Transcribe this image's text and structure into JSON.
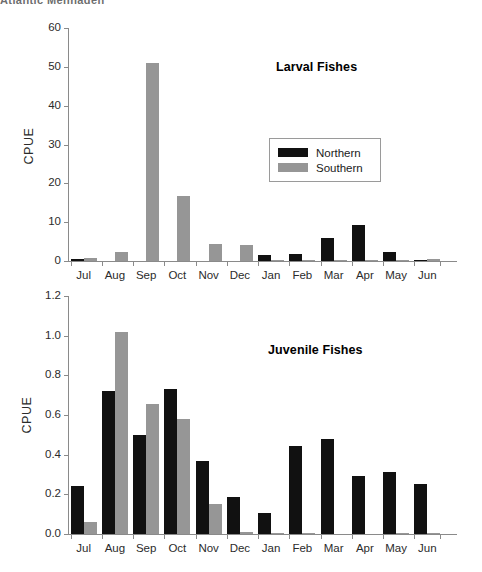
{
  "cutoff_header": "Atlantic Menhaden",
  "legend": {
    "items": [
      {
        "label": "Northern",
        "color": "#111111",
        "key": "northern"
      },
      {
        "label": "Southern",
        "color": "#969696",
        "key": "southern"
      }
    ]
  },
  "axis_titles": {
    "larval_y": "CPUE",
    "juvenile_y": "CPUE"
  },
  "chart_data": [
    {
      "id": "larval",
      "type": "bar",
      "title": "Larval Fishes",
      "xlabel": "",
      "ylabel": "CPUE",
      "ylim": [
        0,
        60
      ],
      "yticks": [
        0,
        10,
        20,
        30,
        40,
        50,
        60
      ],
      "ytick_labels": [
        "0",
        "10",
        "20",
        "30",
        "40",
        "50",
        "60"
      ],
      "grid": false,
      "legend_position": "upper-right-inside",
      "categories": [
        "Jul",
        "Aug",
        "Sep",
        "Oct",
        "Nov",
        "Dec",
        "Jan",
        "Feb",
        "Mar",
        "Apr",
        "May",
        "Jun"
      ],
      "series": [
        {
          "name": "Northern",
          "color": "#111111",
          "values": [
            0.6,
            0.0,
            0.0,
            0.0,
            0.0,
            0.0,
            1.6,
            1.8,
            5.9,
            9.2,
            2.4,
            0.2
          ]
        },
        {
          "name": "Southern",
          "color": "#969696",
          "values": [
            0.9,
            2.4,
            51.0,
            16.8,
            4.5,
            4.0,
            0.3,
            0.05,
            0.1,
            0.05,
            0.1,
            0.6
          ]
        }
      ]
    },
    {
      "id": "juvenile",
      "type": "bar",
      "title": "Juvenile Fishes",
      "xlabel": "",
      "ylabel": "CPUE",
      "ylim": [
        0,
        1.2
      ],
      "yticks": [
        0.0,
        0.2,
        0.4,
        0.6,
        0.8,
        1.0,
        1.2
      ],
      "ytick_labels": [
        "0.0",
        "0.2",
        "0.4",
        "0.6",
        "0.8",
        "1.0",
        "1.2"
      ],
      "grid": false,
      "legend_position": "none",
      "categories": [
        "Jul",
        "Aug",
        "Sep",
        "Oct",
        "Nov",
        "Dec",
        "Jan",
        "Feb",
        "Mar",
        "Apr",
        "May",
        "Jun"
      ],
      "series": [
        {
          "name": "Northern",
          "color": "#111111",
          "values": [
            0.24,
            0.72,
            0.5,
            0.73,
            0.37,
            0.185,
            0.105,
            0.445,
            0.48,
            0.29,
            0.315,
            0.25
          ]
        },
        {
          "name": "Southern",
          "color": "#969696",
          "values": [
            0.06,
            1.02,
            0.655,
            0.58,
            0.15,
            0.01,
            0.005,
            0.002,
            0.0,
            0.0,
            0.003,
            0.005
          ]
        }
      ]
    }
  ]
}
